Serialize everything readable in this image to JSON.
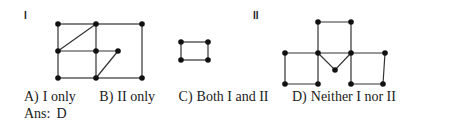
{
  "figures": {
    "I": {
      "label": "I"
    },
    "II": {
      "label": "II"
    }
  },
  "options": [
    {
      "key": "A)",
      "text": "I only"
    },
    {
      "key": "B)",
      "text": "II only"
    },
    {
      "key": "C)",
      "text": "Both I and II"
    },
    {
      "key": "D)",
      "text": "Neither I nor II"
    }
  ],
  "answer": {
    "prefix": "Ans:",
    "value": "D"
  }
}
